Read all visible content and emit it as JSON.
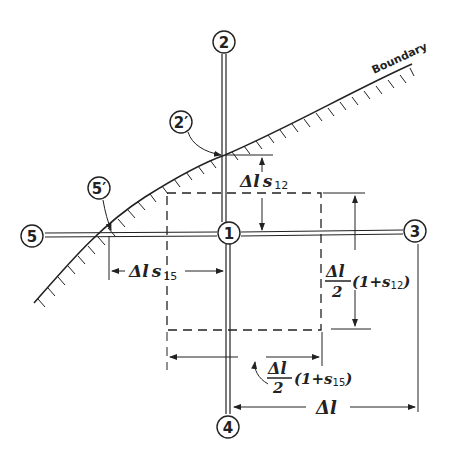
{
  "diagram": {
    "boundary_label": "Boundary",
    "nodes": [
      {
        "id": "1",
        "label": "1",
        "x": 229,
        "y": 233
      },
      {
        "id": "2",
        "label": "2",
        "x": 224,
        "y": 42
      },
      {
        "id": "3",
        "label": "3",
        "x": 415,
        "y": 231
      },
      {
        "id": "4",
        "label": "4",
        "x": 228,
        "y": 427
      },
      {
        "id": "5",
        "label": "5",
        "x": 32,
        "y": 236
      },
      {
        "id": "2p",
        "label": "2′",
        "x": 181,
        "y": 122
      },
      {
        "id": "5p",
        "label": "5′",
        "x": 99,
        "y": 188
      }
    ],
    "labels": {
      "dl_s12": {
        "main": "Δl",
        "s": "s",
        "sub": "12"
      },
      "dl_s15": {
        "main": "Δl",
        "s": "s",
        "sub": "15"
      },
      "half_dl_s12": {
        "num": "Δl",
        "den": "2",
        "paren": "(1+s",
        "sub": "12",
        "close": ")"
      },
      "half_dl_s15": {
        "num": "Δl",
        "den": "2",
        "paren": "(1+s",
        "sub": "15",
        "close": ")"
      },
      "dl": "Δl"
    },
    "colors": {
      "ink": "#222222",
      "background": "#ffffff"
    }
  }
}
